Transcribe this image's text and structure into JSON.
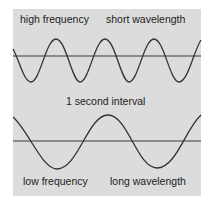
{
  "diagram": {
    "top_wave": {
      "left_label": "high frequency",
      "right_label": "short wavelength",
      "cycles_in_interval": 4
    },
    "middle_label": "1 second interval",
    "bottom_wave": {
      "left_label": "low frequency",
      "right_label": "long wavelength",
      "cycles_in_interval": 2
    },
    "colors": {
      "background": "#dcdcdc",
      "baseline": "#8a8a8a",
      "wave": "#333333",
      "text": "#222222"
    }
  }
}
